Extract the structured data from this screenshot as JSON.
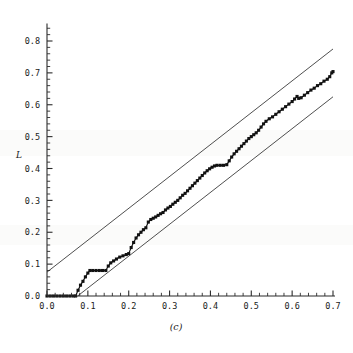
{
  "chart_data": {
    "type": "line",
    "title": "",
    "subtitle": "",
    "caption": "(c)",
    "xlabel": "",
    "ylabel": "L",
    "xlim": [
      0.0,
      0.7
    ],
    "ylim": [
      0.0,
      0.85
    ],
    "grid": false,
    "legend": "none",
    "x_ticks": [
      0.0,
      0.1,
      0.2,
      0.3,
      0.4,
      0.5,
      0.6,
      0.7
    ],
    "x_tick_labels": [
      "0.0",
      "0.1",
      "0.2",
      "0.3",
      "0.4",
      "0.5",
      "0.6",
      "0.7"
    ],
    "x_minor_step": 0.02,
    "y_ticks": [
      0.0,
      0.1,
      0.2,
      0.3,
      0.4,
      0.5,
      0.6,
      0.7,
      0.8
    ],
    "y_tick_labels": [
      "0.0",
      "0.1",
      "0.2",
      "0.3",
      "0.4",
      "0.5",
      "0.6",
      "0.7",
      "0.8"
    ],
    "y_minor_step": 0.02,
    "series": [
      {
        "name": "empirical-staircase",
        "style": "line-with-square-markers",
        "color": "#111111",
        "points": [
          [
            0.0,
            0.0
          ],
          [
            0.008,
            0.0
          ],
          [
            0.016,
            0.0
          ],
          [
            0.024,
            0.0
          ],
          [
            0.032,
            0.0
          ],
          [
            0.04,
            0.0
          ],
          [
            0.048,
            0.0
          ],
          [
            0.056,
            0.0
          ],
          [
            0.064,
            0.0
          ],
          [
            0.07,
            0.0
          ],
          [
            0.076,
            0.018
          ],
          [
            0.082,
            0.034
          ],
          [
            0.088,
            0.046
          ],
          [
            0.094,
            0.06
          ],
          [
            0.1,
            0.072
          ],
          [
            0.105,
            0.08
          ],
          [
            0.112,
            0.08
          ],
          [
            0.12,
            0.08
          ],
          [
            0.128,
            0.08
          ],
          [
            0.136,
            0.08
          ],
          [
            0.144,
            0.08
          ],
          [
            0.15,
            0.094
          ],
          [
            0.156,
            0.104
          ],
          [
            0.163,
            0.11
          ],
          [
            0.17,
            0.116
          ],
          [
            0.178,
            0.122
          ],
          [
            0.186,
            0.126
          ],
          [
            0.194,
            0.13
          ],
          [
            0.2,
            0.133
          ],
          [
            0.206,
            0.152
          ],
          [
            0.212,
            0.168
          ],
          [
            0.218,
            0.182
          ],
          [
            0.224,
            0.192
          ],
          [
            0.23,
            0.2
          ],
          [
            0.236,
            0.208
          ],
          [
            0.242,
            0.214
          ],
          [
            0.248,
            0.232
          ],
          [
            0.254,
            0.24
          ],
          [
            0.26,
            0.244
          ],
          [
            0.266,
            0.248
          ],
          [
            0.272,
            0.253
          ],
          [
            0.278,
            0.258
          ],
          [
            0.284,
            0.262
          ],
          [
            0.29,
            0.27
          ],
          [
            0.296,
            0.276
          ],
          [
            0.302,
            0.281
          ],
          [
            0.308,
            0.288
          ],
          [
            0.314,
            0.294
          ],
          [
            0.32,
            0.3
          ],
          [
            0.326,
            0.308
          ],
          [
            0.332,
            0.316
          ],
          [
            0.338,
            0.322
          ],
          [
            0.344,
            0.33
          ],
          [
            0.35,
            0.338
          ],
          [
            0.356,
            0.346
          ],
          [
            0.362,
            0.354
          ],
          [
            0.368,
            0.362
          ],
          [
            0.374,
            0.37
          ],
          [
            0.38,
            0.378
          ],
          [
            0.386,
            0.386
          ],
          [
            0.392,
            0.393
          ],
          [
            0.398,
            0.399
          ],
          [
            0.404,
            0.404
          ],
          [
            0.41,
            0.408
          ],
          [
            0.416,
            0.41
          ],
          [
            0.424,
            0.41
          ],
          [
            0.432,
            0.41
          ],
          [
            0.44,
            0.412
          ],
          [
            0.446,
            0.424
          ],
          [
            0.452,
            0.436
          ],
          [
            0.458,
            0.446
          ],
          [
            0.464,
            0.454
          ],
          [
            0.47,
            0.462
          ],
          [
            0.476,
            0.47
          ],
          [
            0.482,
            0.478
          ],
          [
            0.488,
            0.486
          ],
          [
            0.494,
            0.494
          ],
          [
            0.5,
            0.5
          ],
          [
            0.506,
            0.506
          ],
          [
            0.512,
            0.512
          ],
          [
            0.518,
            0.52
          ],
          [
            0.524,
            0.53
          ],
          [
            0.53,
            0.54
          ],
          [
            0.536,
            0.548
          ],
          [
            0.544,
            0.556
          ],
          [
            0.552,
            0.562
          ],
          [
            0.56,
            0.57
          ],
          [
            0.568,
            0.578
          ],
          [
            0.576,
            0.586
          ],
          [
            0.584,
            0.594
          ],
          [
            0.592,
            0.602
          ],
          [
            0.6,
            0.61
          ],
          [
            0.606,
            0.618
          ],
          [
            0.612,
            0.626
          ],
          [
            0.616,
            0.62
          ],
          [
            0.622,
            0.622
          ],
          [
            0.63,
            0.63
          ],
          [
            0.638,
            0.638
          ],
          [
            0.646,
            0.646
          ],
          [
            0.654,
            0.652
          ],
          [
            0.662,
            0.66
          ],
          [
            0.67,
            0.666
          ],
          [
            0.678,
            0.674
          ],
          [
            0.686,
            0.68
          ],
          [
            0.692,
            0.688
          ],
          [
            0.697,
            0.7
          ],
          [
            0.7,
            0.704
          ]
        ]
      }
    ],
    "reference_lines": [
      {
        "name": "upper-bound",
        "style": "solid-thin",
        "color": "#2f2f2f",
        "x": [
          0.0,
          0.7
        ],
        "y": [
          0.075,
          0.775
        ]
      },
      {
        "name": "lower-bound",
        "style": "solid-thin",
        "color": "#2f2f2f",
        "x": [
          0.0,
          0.7
        ],
        "y": [
          -0.075,
          0.625
        ]
      }
    ],
    "annotations": []
  }
}
